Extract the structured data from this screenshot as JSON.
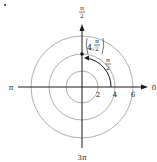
{
  "diagram": {
    "type": "polar-coordinate-plot",
    "center": [
      82,
      87
    ],
    "scale_px_per_unit": 8.2,
    "circles": [
      {
        "r": 2,
        "label": "2"
      },
      {
        "r": 4,
        "label": "4"
      },
      {
        "r": 6,
        "label": "6"
      }
    ],
    "axis_labels": {
      "right": "0",
      "top_num": "π",
      "top_den": "2",
      "left": "π",
      "bottom": "3π"
    },
    "point": {
      "r": 4,
      "theta_label_num": "π",
      "theta_label_den": "2",
      "label_r": "4,"
    },
    "arc_label": {
      "num": "π",
      "den": "2"
    },
    "colors": {
      "axis": "#1a1a1a",
      "circle": "#9a9a9a",
      "point": "#1a1a1a"
    }
  }
}
